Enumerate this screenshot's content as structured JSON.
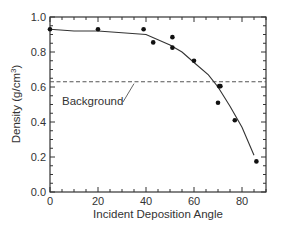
{
  "chart_data": {
    "type": "scatter",
    "title": "",
    "xlabel": "Incident Deposition Angle",
    "ylabel": "Density (g/cm³)",
    "ylabel_main": "Density (g/cm",
    "ylabel_sup": "3",
    "ylabel_close": ")",
    "xlim": [
      0,
      90
    ],
    "ylim": [
      0.0,
      1.0
    ],
    "x_ticks": [
      0,
      20,
      40,
      60,
      80
    ],
    "x_tick_labels": [
      "0",
      "20",
      "40",
      "60",
      "80"
    ],
    "y_ticks": [
      0.0,
      0.2,
      0.4,
      0.6,
      0.8,
      1.0
    ],
    "y_tick_labels": [
      "0.0",
      "0.2",
      "0.4",
      "0.6",
      "0.8",
      "1.0"
    ],
    "grid": false,
    "legend": null,
    "series": [
      {
        "name": "Measured density",
        "kind": "scatter",
        "x": [
          0,
          20,
          39,
          43,
          51,
          51,
          60,
          70,
          70.5,
          71,
          77,
          86
        ],
        "y": [
          0.93,
          0.93,
          0.93,
          0.855,
          0.885,
          0.825,
          0.75,
          0.51,
          0.605,
          0.605,
          0.41,
          0.175
        ]
      },
      {
        "name": "Model fit",
        "kind": "line",
        "x": [
          0,
          10,
          20,
          40,
          50,
          55,
          60,
          66,
          70,
          75,
          80,
          85
        ],
        "y": [
          0.93,
          0.92,
          0.92,
          0.9,
          0.84,
          0.8,
          0.74,
          0.67,
          0.6,
          0.49,
          0.37,
          0.21
        ]
      },
      {
        "name": "Background",
        "kind": "hline-dashed",
        "y": 0.63
      }
    ],
    "annotations": [
      {
        "text": "Background",
        "x": 5,
        "y": 0.52,
        "arrow_to": [
          35,
          0.625
        ]
      }
    ]
  },
  "colors": {
    "axis": "#333333",
    "line": "#333333",
    "points": "#111111",
    "background_line": "#555555"
  }
}
